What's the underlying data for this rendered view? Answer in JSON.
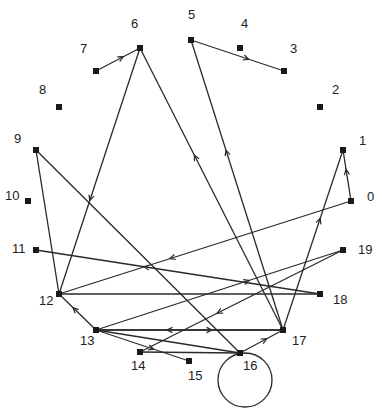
{
  "diagram": {
    "type": "directed-graph",
    "nodes": [
      {
        "id": "0",
        "x": 351,
        "y": 201,
        "lx": 367,
        "ly": 201
      },
      {
        "id": "1",
        "x": 343,
        "y": 150,
        "lx": 359,
        "ly": 145
      },
      {
        "id": "2",
        "x": 320,
        "y": 107,
        "lx": 332,
        "ly": 94
      },
      {
        "id": "3",
        "x": 284,
        "y": 71,
        "lx": 290,
        "ly": 53
      },
      {
        "id": "4",
        "x": 240,
        "y": 48,
        "lx": 241,
        "ly": 28
      },
      {
        "id": "5",
        "x": 191,
        "y": 40,
        "lx": 188,
        "ly": 19
      },
      {
        "id": "6",
        "x": 140,
        "y": 48,
        "lx": 131,
        "ly": 28
      },
      {
        "id": "7",
        "x": 96,
        "y": 71,
        "lx": 80,
        "ly": 53
      },
      {
        "id": "8",
        "x": 59,
        "y": 107,
        "lx": 39,
        "ly": 94
      },
      {
        "id": "9",
        "x": 36,
        "y": 150,
        "lx": 14,
        "ly": 143
      },
      {
        "id": "10",
        "x": 28,
        "y": 201,
        "lx": 5,
        "ly": 200
      },
      {
        "id": "11",
        "x": 36,
        "y": 250,
        "lx": 12,
        "ly": 253
      },
      {
        "id": "12",
        "x": 59,
        "y": 294,
        "lx": 39,
        "ly": 305
      },
      {
        "id": "13",
        "x": 96,
        "y": 330,
        "lx": 80,
        "ly": 345
      },
      {
        "id": "14",
        "x": 140,
        "y": 352,
        "lx": 131,
        "ly": 370
      },
      {
        "id": "15",
        "x": 189,
        "y": 361,
        "lx": 188,
        "ly": 380
      },
      {
        "id": "16",
        "x": 240,
        "y": 353,
        "lx": 243,
        "ly": 370
      },
      {
        "id": "17",
        "x": 283,
        "y": 330,
        "lx": 292,
        "ly": 345
      },
      {
        "id": "18",
        "x": 320,
        "y": 294,
        "lx": 333,
        "ly": 304
      },
      {
        "id": "19",
        "x": 343,
        "y": 250,
        "lx": 358,
        "ly": 254
      }
    ],
    "edges": [
      {
        "from": "7",
        "to": "6",
        "arrow": true
      },
      {
        "from": "5",
        "to": "3",
        "arrow": true
      },
      {
        "from": "17",
        "to": "6",
        "arrow": true
      },
      {
        "from": "17",
        "to": "5",
        "arrow": true
      },
      {
        "from": "6",
        "to": "12",
        "arrow": true
      },
      {
        "from": "9",
        "to": "12",
        "arrow": false
      },
      {
        "from": "9",
        "to": "16",
        "arrow": false
      },
      {
        "from": "18",
        "to": "11",
        "arrow": true
      },
      {
        "from": "0",
        "to": "12",
        "arrow": true
      },
      {
        "from": "12",
        "to": "18",
        "arrow": false
      },
      {
        "from": "0",
        "to": "1",
        "arrow": true
      },
      {
        "from": "17",
        "to": "1",
        "arrow": true
      },
      {
        "from": "13",
        "to": "19",
        "arrow": true
      },
      {
        "from": "19",
        "to": "14",
        "arrow": true
      },
      {
        "from": "13",
        "to": "12",
        "arrow": true
      },
      {
        "from": "13",
        "to": "15",
        "arrow": true
      },
      {
        "from": "13",
        "to": "17",
        "arrow": true
      },
      {
        "from": "17",
        "to": "13",
        "arrow": true
      },
      {
        "from": "14",
        "to": "16",
        "arrow": false
      },
      {
        "from": "16",
        "to": "17",
        "arrow": true
      },
      {
        "from": "13",
        "to": "16",
        "arrow": false
      },
      {
        "from": "16",
        "to": "16",
        "arrow": false,
        "loop": true
      }
    ],
    "self_loop": {
      "node": "16",
      "cx": 245,
      "cy": 380,
      "r": 27
    }
  }
}
